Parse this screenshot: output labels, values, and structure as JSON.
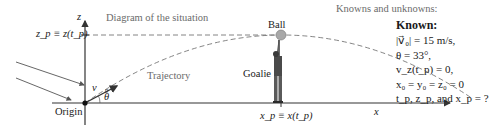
{
  "diagram": {
    "title": "Diagram of the situation",
    "axes": {
      "vertical_label": "z",
      "horizontal_label": "x"
    },
    "labels": {
      "zp": "z_p ≡ z(t_p)",
      "xp": "x_p ≡ x(t_p)",
      "origin": "Origin",
      "v0": "v⃗₀",
      "theta": "θ",
      "trajectory": "Trajectory",
      "ball": "Ball",
      "goalie": "Goalie"
    },
    "colors": {
      "axis": "#333333",
      "dashed": "#777777",
      "ball": "#a8a8a8",
      "arrow": "#555555",
      "text_gray": "#6b6b6b"
    }
  },
  "knowns": {
    "header": "Knowns and unknowns:",
    "title": "Known:",
    "lines": [
      "|v⃗₀| = 15 m/s,",
      "θ = 33°,",
      "v_z(t_p) = 0,",
      "x₀ = y₀ = z₀ = 0",
      "t_p, z_p, and x_p = ?"
    ]
  }
}
